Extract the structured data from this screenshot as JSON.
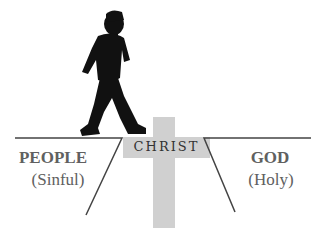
{
  "diagram": {
    "labels": {
      "people": "PEOPLE",
      "people_sub": "(Sinful)",
      "god": "GOD",
      "god_sub": "(Holy)",
      "christ": "CHRIST"
    },
    "icons": {
      "figure": "walking-man-silhouette",
      "cross": "cross-icon"
    },
    "colors": {
      "cross": "#d0d0d0",
      "line": "#444444",
      "text": "#606060",
      "figure": "#111111"
    }
  }
}
